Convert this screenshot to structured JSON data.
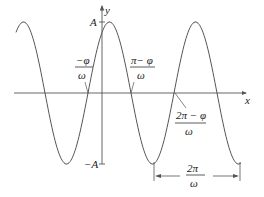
{
  "diagram": {
    "axes": {
      "x_label": "x",
      "y_label": "y",
      "y_max_label": "A",
      "y_min_label": "−A"
    },
    "annotations": {
      "zero1": {
        "num": "−φ",
        "den": "ω"
      },
      "zero2": {
        "num": "π− φ",
        "den": "ω"
      },
      "zero3": {
        "num": "2π − φ",
        "den": "ω"
      },
      "period": {
        "num": "2π",
        "den": "ω"
      }
    },
    "colors": {
      "curve": "#555555",
      "axis": "#555555",
      "text": "#222222",
      "background": "#ffffff"
    }
  }
}
